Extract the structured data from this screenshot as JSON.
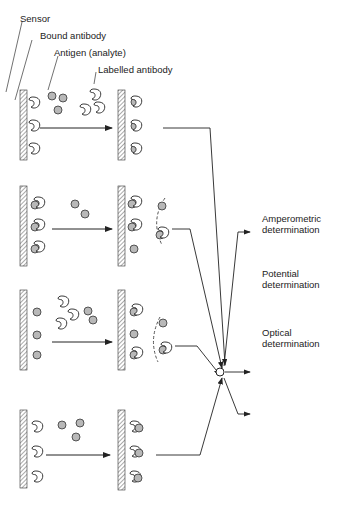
{
  "labels": {
    "sensor": "Sensor",
    "bound_antibody": "Bound antibody",
    "antigen": "Antigen (analyte)",
    "labelled_antibody": "Labelled antibody"
  },
  "outputs": [
    {
      "line1": "Amperometric",
      "line2": "determination"
    },
    {
      "line1": "Potential",
      "line2": "determination"
    },
    {
      "line1": "Optical",
      "line2": "determination"
    }
  ],
  "colors": {
    "line": "#222222",
    "antigen_fill": "#b8b8b8",
    "hatch": "#555555"
  }
}
